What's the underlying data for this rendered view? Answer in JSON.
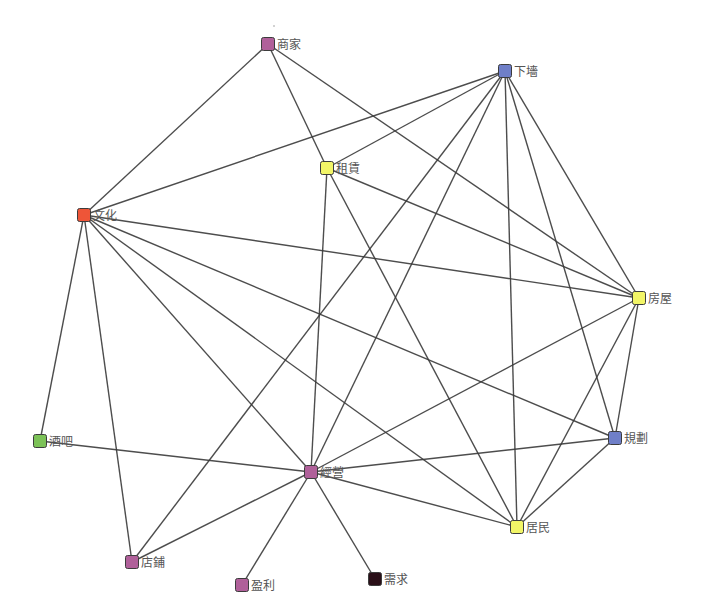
{
  "diagram": {
    "type": "network-graph",
    "node_size": 13,
    "colors": {
      "purple": "#b0609a",
      "blue": "#6f7fc8",
      "yellow": "#f2f567",
      "red": "#ee5538",
      "green": "#7cc257",
      "dark": "#2a0f18",
      "edge": "#3a3a3a",
      "label": "#555555"
    },
    "nodes": [
      {
        "id": "shangjia",
        "label": "商家",
        "x": 268,
        "y": 44,
        "color": "#b0609a"
      },
      {
        "id": "xiaqiang",
        "label": "下墻",
        "x": 505,
        "y": 71,
        "color": "#6f7fc8"
      },
      {
        "id": "zulin",
        "label": "租賃",
        "x": 327,
        "y": 168,
        "color": "#f2f567"
      },
      {
        "id": "wenhua",
        "label": "文化",
        "x": 84,
        "y": 215,
        "color": "#ee5538"
      },
      {
        "id": "fangwu",
        "label": "房屋",
        "x": 639,
        "y": 298,
        "color": "#f2f567"
      },
      {
        "id": "jiuba",
        "label": "酒吧",
        "x": 40,
        "y": 441,
        "color": "#7cc257"
      },
      {
        "id": "guihua",
        "label": "規劃",
        "x": 615,
        "y": 438,
        "color": "#6f7fc8"
      },
      {
        "id": "jingying",
        "label": "經營",
        "x": 311,
        "y": 472,
        "color": "#b0609a"
      },
      {
        "id": "jumin",
        "label": "居民",
        "x": 517,
        "y": 527,
        "color": "#f2f567"
      },
      {
        "id": "dianpu",
        "label": "店鋪",
        "x": 132,
        "y": 562,
        "color": "#b0609a"
      },
      {
        "id": "yingli",
        "label": "盈利",
        "x": 242,
        "y": 585,
        "color": "#b0609a"
      },
      {
        "id": "xuqiu",
        "label": "需求",
        "x": 375,
        "y": 579,
        "color": "#2a0f18"
      }
    ],
    "edges": [
      [
        "shangjia",
        "wenhua"
      ],
      [
        "shangjia",
        "zulin"
      ],
      [
        "shangjia",
        "fangwu"
      ],
      [
        "xiaqiang",
        "wenhua"
      ],
      [
        "xiaqiang",
        "zulin"
      ],
      [
        "xiaqiang",
        "dianpu"
      ],
      [
        "xiaqiang",
        "jingying"
      ],
      [
        "xiaqiang",
        "jumin"
      ],
      [
        "xiaqiang",
        "guihua"
      ],
      [
        "xiaqiang",
        "fangwu"
      ],
      [
        "zulin",
        "jingying"
      ],
      [
        "zulin",
        "jumin"
      ],
      [
        "zulin",
        "fangwu"
      ],
      [
        "wenhua",
        "jiuba"
      ],
      [
        "wenhua",
        "dianpu"
      ],
      [
        "wenhua",
        "jingying"
      ],
      [
        "wenhua",
        "jumin"
      ],
      [
        "wenhua",
        "guihua"
      ],
      [
        "wenhua",
        "fangwu"
      ],
      [
        "fangwu",
        "jingying"
      ],
      [
        "fangwu",
        "jumin"
      ],
      [
        "fangwu",
        "guihua"
      ],
      [
        "guihua",
        "jingying"
      ],
      [
        "guihua",
        "jumin"
      ],
      [
        "jingying",
        "jiuba"
      ],
      [
        "jingying",
        "jumin"
      ],
      [
        "jingying",
        "dianpu"
      ],
      [
        "jingying",
        "yingli"
      ],
      [
        "jingying",
        "xuqiu"
      ]
    ]
  }
}
